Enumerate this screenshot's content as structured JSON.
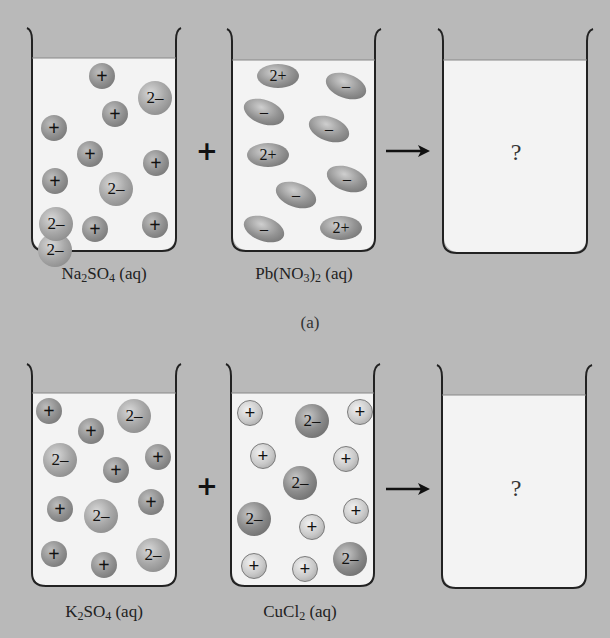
{
  "figure": {
    "background_color": "#b9b9b9",
    "liquid_color": "#f3f3f3",
    "part_a": {
      "caption": "(a)",
      "operator_plus": "+",
      "operator_arrow": "→",
      "beakers": [
        {
          "label_parts": [
            "Na",
            "2",
            "SO",
            "4",
            " (aq)"
          ],
          "ions": [
            {
              "charge": "2–",
              "shape": "sphere-big",
              "x": 38,
              "y": 233
            },
            {
              "charge": "+",
              "shape": "sphere-small",
              "x": 89,
              "y": 63
            },
            {
              "charge": "2–",
              "shape": "sphere-big",
              "x": 138,
              "y": 81
            },
            {
              "charge": "+",
              "shape": "sphere-small",
              "x": 102,
              "y": 101
            },
            {
              "charge": "+",
              "shape": "sphere-small",
              "x": 41,
              "y": 115
            },
            {
              "charge": "+",
              "shape": "sphere-small",
              "x": 77,
              "y": 141
            },
            {
              "charge": "+",
              "shape": "sphere-small",
              "x": 143,
              "y": 150
            },
            {
              "charge": "+",
              "shape": "sphere-small",
              "x": 42,
              "y": 168
            },
            {
              "charge": "2–",
              "shape": "sphere-big",
              "x": 99,
              "y": 172
            },
            {
              "charge": "2–",
              "shape": "sphere-big",
              "x": 39,
              "y": 207
            },
            {
              "charge": "+",
              "shape": "sphere-small",
              "x": 82,
              "y": 216
            },
            {
              "charge": "+",
              "shape": "sphere-small",
              "x": 142,
              "y": 212
            }
          ]
        },
        {
          "label_parts": [
            "Pb(NO",
            "3",
            ")",
            "2",
            " (aq)"
          ],
          "ions": [
            {
              "charge": "2+",
              "shape": "ellipse",
              "x": 257,
              "y": 64,
              "rotate": 0
            },
            {
              "charge": "–",
              "shape": "ellipse",
              "x": 325,
              "y": 74,
              "rotate": 20
            },
            {
              "charge": "–",
              "shape": "ellipse",
              "x": 243,
              "y": 100,
              "rotate": 20
            },
            {
              "charge": "–",
              "shape": "ellipse",
              "x": 308,
              "y": 117,
              "rotate": 20
            },
            {
              "charge": "2+",
              "shape": "ellipse",
              "x": 247,
              "y": 143,
              "rotate": 0
            },
            {
              "charge": "–",
              "shape": "ellipse",
              "x": 326,
              "y": 167,
              "rotate": 20
            },
            {
              "charge": "–",
              "shape": "ellipse",
              "x": 275,
              "y": 183,
              "rotate": 20
            },
            {
              "charge": "–",
              "shape": "ellipse",
              "x": 243,
              "y": 217,
              "rotate": 20
            },
            {
              "charge": "2+",
              "shape": "ellipse",
              "x": 320,
              "y": 216,
              "rotate": 0
            }
          ]
        },
        {
          "label_parts": [],
          "question": "?",
          "ions": []
        }
      ]
    },
    "part_b": {
      "operator_plus": "+",
      "operator_arrow": "→",
      "beakers": [
        {
          "label_parts": [
            "K",
            "2",
            "SO",
            "4",
            " (aq)"
          ],
          "ions": [
            {
              "charge": "+",
              "shape": "sphere-small",
              "x": 36,
              "y": 398
            },
            {
              "charge": "2–",
              "shape": "sphere-big",
              "x": 117,
              "y": 399
            },
            {
              "charge": "+",
              "shape": "sphere-small",
              "x": 78,
              "y": 418
            },
            {
              "charge": "2–",
              "shape": "sphere-big",
              "x": 43,
              "y": 443
            },
            {
              "charge": "+",
              "shape": "sphere-small",
              "x": 145,
              "y": 444
            },
            {
              "charge": "+",
              "shape": "sphere-small",
              "x": 103,
              "y": 457
            },
            {
              "charge": "+",
              "shape": "sphere-small",
              "x": 47,
              "y": 496
            },
            {
              "charge": "+",
              "shape": "sphere-small",
              "x": 138,
              "y": 489
            },
            {
              "charge": "2–",
              "shape": "sphere-big",
              "x": 84,
              "y": 499
            },
            {
              "charge": "+",
              "shape": "sphere-small",
              "x": 41,
              "y": 541
            },
            {
              "charge": "+",
              "shape": "sphere-small",
              "x": 91,
              "y": 552
            },
            {
              "charge": "2–",
              "shape": "sphere-big",
              "x": 136,
              "y": 538
            }
          ]
        },
        {
          "label_parts": [
            "CuCl",
            "2",
            " (aq)"
          ],
          "ions": [
            {
              "charge": "+",
              "shape": "sphere-light",
              "x": 237,
              "y": 400
            },
            {
              "charge": "2–",
              "shape": "sphere-dark",
              "x": 295,
              "y": 404
            },
            {
              "charge": "+",
              "shape": "sphere-light",
              "x": 347,
              "y": 399
            },
            {
              "charge": "+",
              "shape": "sphere-light",
              "x": 250,
              "y": 443
            },
            {
              "charge": "+",
              "shape": "sphere-light",
              "x": 333,
              "y": 446
            },
            {
              "charge": "2–",
              "shape": "sphere-dark",
              "x": 283,
              "y": 466
            },
            {
              "charge": "2–",
              "shape": "sphere-dark",
              "x": 237,
              "y": 502
            },
            {
              "charge": "+",
              "shape": "sphere-light",
              "x": 343,
              "y": 498
            },
            {
              "charge": "+",
              "shape": "sphere-light",
              "x": 299,
              "y": 514
            },
            {
              "charge": "+",
              "shape": "sphere-light",
              "x": 241,
              "y": 553
            },
            {
              "charge": "+",
              "shape": "sphere-light",
              "x": 292,
              "y": 556
            },
            {
              "charge": "2–",
              "shape": "sphere-dark",
              "x": 333,
              "y": 542
            }
          ]
        },
        {
          "label_parts": [],
          "question": "?",
          "ions": []
        }
      ]
    }
  }
}
